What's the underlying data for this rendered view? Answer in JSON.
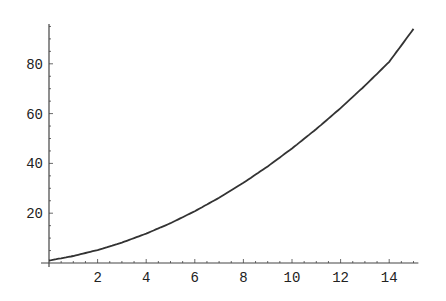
{
  "chart_data": {
    "type": "line",
    "title": "",
    "xlabel": "",
    "ylabel": "",
    "xlim": [
      0,
      15.2
    ],
    "ylim": [
      0,
      97
    ],
    "grid": false,
    "legend": null,
    "x_ticks": [
      2,
      4,
      6,
      8,
      10,
      12,
      14
    ],
    "y_ticks": [
      20,
      40,
      60,
      80
    ],
    "series": [
      {
        "name": "curve",
        "x": [
          0,
          1,
          2,
          3,
          4,
          5,
          6,
          7,
          8,
          9,
          10,
          11,
          12,
          13,
          14,
          15
        ],
        "y": [
          1,
          2.8,
          5.2,
          8.2,
          11.8,
          16,
          20.8,
          26.2,
          32.2,
          38.8,
          46,
          53.8,
          62.2,
          71.2,
          80.8,
          94
        ]
      }
    ]
  },
  "colors": {
    "line": "#333333",
    "axis": "#444444",
    "background": "#ffffff"
  }
}
